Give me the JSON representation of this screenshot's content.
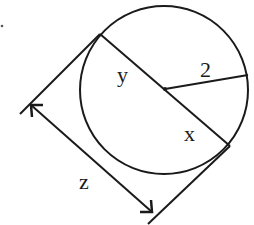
{
  "diagram": {
    "labels": {
      "y": "y",
      "radius": "2",
      "x": "x",
      "z": "z"
    },
    "colors": {
      "stroke": "#1a1a1a",
      "background": "#ffffff"
    }
  }
}
